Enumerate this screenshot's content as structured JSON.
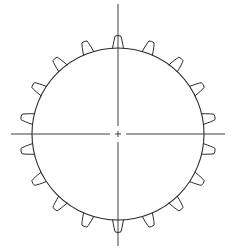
{
  "diagram": {
    "type": "gear",
    "canvas": {
      "width": 234,
      "height": 251
    },
    "gear": {
      "center": {
        "x": 118,
        "y": 134
      },
      "root_radius": 86,
      "tooth_count": 18,
      "tooth_start_angle_deg": 10,
      "tooth_pitch_deg": 20,
      "tooth_height": 12,
      "tooth_base_halfwidth_deg": 3.6,
      "tooth_tip_halfwidth_deg": 1.6
    },
    "center_lines": {
      "horizontal": {
        "x1": 11,
        "x2": 225,
        "y": 134
      },
      "vertical": {
        "x": 118,
        "y1": 4,
        "y2": 246
      },
      "center_gap": 5,
      "center_cross_size": 3
    },
    "colors": {
      "line": "#2b2b2b",
      "background": "#ffffff"
    }
  }
}
